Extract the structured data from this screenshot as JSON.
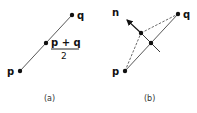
{
  "panels": [
    {
      "caption": "(a)",
      "labels": {
        "p": "p",
        "q": "q",
        "mid_numerator": "p + q",
        "mid_denominator": "2"
      }
    },
    {
      "caption": "(b)",
      "labels": {
        "p": "p",
        "q": "q",
        "n": "n"
      }
    }
  ],
  "colors": {
    "ink": "#111111",
    "line": "#444444"
  }
}
